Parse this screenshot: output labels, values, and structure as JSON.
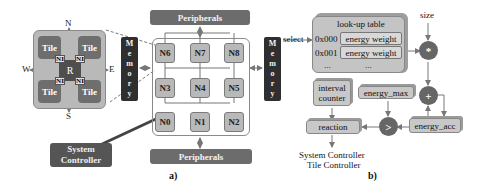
{
  "panel_a": {
    "caption": "a)",
    "router": {
      "center_label": "R",
      "tiles": [
        "Tile",
        "Tile",
        "Tile",
        "Tile"
      ],
      "ni_labels": [
        "NI",
        "NI",
        "NI",
        "NI"
      ],
      "directions": {
        "north": "N",
        "south": "S",
        "west": "W",
        "east": "E"
      }
    },
    "peripherals_top": "Peripherals",
    "peripherals_bottom": "Peripherals",
    "memory_left": [
      "M",
      "e",
      "m",
      "o",
      "r",
      "y"
    ],
    "memory_right": [
      "M",
      "e",
      "m",
      "o",
      "r",
      "y"
    ],
    "nodes": [
      {
        "id": "N6"
      },
      {
        "id": "N7"
      },
      {
        "id": "N8"
      },
      {
        "id": "N3"
      },
      {
        "id": "N4"
      },
      {
        "id": "N5"
      },
      {
        "id": "N0"
      },
      {
        "id": "N1"
      },
      {
        "id": "N2"
      }
    ],
    "system_controller": {
      "line1": "System",
      "line2": "Controller"
    }
  },
  "panel_b": {
    "caption": "b)",
    "select_label": "select",
    "size_label": "size",
    "lookup_table": {
      "title": "look-up table",
      "rows": [
        {
          "addr": "0x000",
          "value": "energy weight"
        },
        {
          "addr": "0x001",
          "value": "energy weight"
        },
        {
          "addr": "...",
          "value": "..."
        }
      ]
    },
    "multiply_op": "*",
    "add_op": "+",
    "compare_op": ">",
    "interval_counter": {
      "line1": "interval",
      "line2": "counter"
    },
    "energy_max": "energy_max",
    "energy_acc": "energy_acc",
    "reaction": "reaction",
    "outputs": [
      "System Controller",
      "Tile Controller"
    ]
  },
  "colors": {
    "dark": "#2f2f2f",
    "medium": "#6c6c6c",
    "light": "#b9b9b9",
    "line": "#777777"
  }
}
